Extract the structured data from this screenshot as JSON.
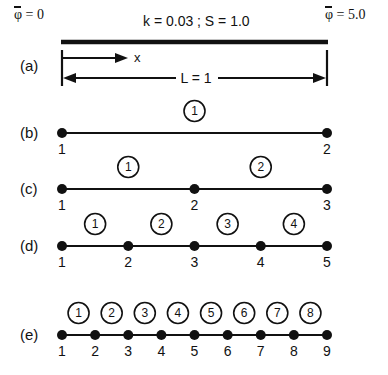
{
  "figure": {
    "geometry": {
      "x_left": 62,
      "x_right": 327,
      "width": 388,
      "height": 375
    },
    "top_text": "k = 0.03 ; S = 1.0",
    "bc_left": {
      "symbol": "φ",
      "overbar": true,
      "equals": " = 0"
    },
    "bc_right": {
      "symbol": "φ",
      "overbar": true,
      "equals": " = 5.0"
    },
    "axis_label": "x",
    "length_label": "L = 1"
  },
  "panels": [
    {
      "id": "a",
      "label": "(a)",
      "label_x": 20,
      "label_y": 66,
      "type": "domain",
      "bar_y": 42,
      "tick_top": 50,
      "tick_bottom": 86,
      "x_arrow_y": 58,
      "x_arrow_end": 128,
      "dim_y": 78
    },
    {
      "id": "b",
      "label": "(b)",
      "label_x": 20,
      "label_y": 133,
      "type": "mesh",
      "line_y": 133,
      "nodes": [
        "1",
        "2"
      ],
      "elements": [
        "1"
      ]
    },
    {
      "id": "c",
      "label": "(c)",
      "label_x": 20,
      "label_y": 189,
      "type": "mesh",
      "line_y": 189,
      "nodes": [
        "1",
        "2",
        "3"
      ],
      "elements": [
        "1",
        "2"
      ]
    },
    {
      "id": "d",
      "label": "(d)",
      "label_x": 20,
      "label_y": 246,
      "type": "mesh",
      "line_y": 246,
      "nodes": [
        "1",
        "2",
        "3",
        "4",
        "5"
      ],
      "elements": [
        "1",
        "2",
        "3",
        "4"
      ]
    },
    {
      "id": "e",
      "label": "(e)",
      "label_x": 20,
      "label_y": 335,
      "type": "mesh",
      "line_y": 335,
      "nodes": [
        "1",
        "2",
        "3",
        "4",
        "5",
        "6",
        "7",
        "8",
        "9"
      ],
      "elements": [
        "1",
        "2",
        "3",
        "4",
        "5",
        "6",
        "7",
        "8"
      ]
    }
  ],
  "style": {
    "ink": "#111111",
    "background": "#ffffff",
    "node_radius": 5,
    "elem_circle_radius": 10.5,
    "mesh_line_width": 2.2,
    "bar_thickness": 4.5
  }
}
